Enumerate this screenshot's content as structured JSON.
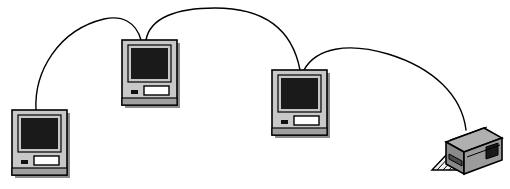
{
  "diagram": {
    "title": "AppleTalk network: three Macintosh computers daisy-chained to a laser printer",
    "type": "network-topology-illustration",
    "width": 510,
    "height": 189,
    "background_color": "#ffffff",
    "line_color": "#000000",
    "palette": {
      "case_light": "#c8c8c8",
      "case_mid": "#b4b4b4",
      "case_shadow": "#8c8c8c",
      "base_strip": "#a0a0a0",
      "screen_dark": "#1a1a1a",
      "slot_white": "#ffffff",
      "outline": "#000000",
      "printer_top": "#b0b0b0",
      "printer_front": "#8a8a8a",
      "printer_side": "#6e6e6e",
      "printer_panel": "#1a1a1a",
      "paper_white": "#f2f2f2"
    },
    "nodes": [
      {
        "id": "computer-1",
        "label": "Macintosh computer 1",
        "kind": "computer",
        "x": 12,
        "y": 110,
        "width": 58,
        "height": 68,
        "port_x": 36,
        "port_y": 110,
        "screen_label": "display",
        "slot_label": "floppy-disk-slot",
        "led_label": "power-indicator"
      },
      {
        "id": "computer-2",
        "label": "Macintosh computer 2",
        "kind": "computer",
        "x": 122,
        "y": 40,
        "width": 59,
        "height": 68,
        "port_x": 143,
        "port_y": 40,
        "screen_label": "display",
        "slot_label": "floppy-disk-slot",
        "led_label": "power-indicator"
      },
      {
        "id": "computer-3",
        "label": "Macintosh computer 3",
        "kind": "computer",
        "x": 272,
        "y": 70,
        "width": 59,
        "height": 68,
        "port_x": 298,
        "port_y": 70,
        "screen_label": "display",
        "slot_label": "floppy-disk-slot",
        "led_label": "power-indicator"
      },
      {
        "id": "printer-1",
        "label": "Laser printer",
        "kind": "printer",
        "x": 432,
        "y": 126,
        "width": 70,
        "height": 58,
        "port_x": 466,
        "port_y": 130,
        "tray_label": "paper-output-tray",
        "panel_label": "printer-end-panel"
      }
    ],
    "links": [
      {
        "id": "cable-1",
        "label": "Network cable from computer 1 to computer 2",
        "from": "computer-1",
        "to": "computer-2",
        "path": "M 36 110 C 34 72 58 30 104 19 C 122 15 136 22 141 40",
        "stroke_width": 1.4
      },
      {
        "id": "cable-2",
        "label": "Network cable from computer 2 to computer 3",
        "from": "computer-2",
        "to": "computer-3",
        "path": "M 146 40 C 150 18 176 8 215 8 C 262 8 292 28 300 70",
        "stroke_width": 1.4
      },
      {
        "id": "cable-3",
        "label": "Network cable from computer 3 to printer",
        "from": "computer-3",
        "to": "printer-1",
        "path": "M 304 70 C 316 48 348 42 388 54 C 434 68 462 96 466 130",
        "stroke_width": 1.4
      }
    ]
  }
}
